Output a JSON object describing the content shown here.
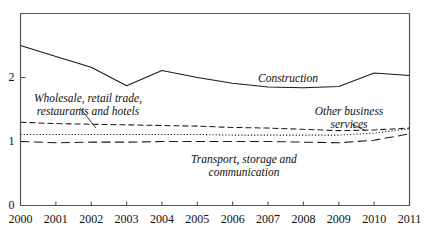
{
  "chart_data": {
    "type": "line",
    "title": "",
    "subtitle": "",
    "xlabel": "",
    "ylabel": "",
    "xlim": [
      2000,
      2011
    ],
    "ylim": [
      0,
      3
    ],
    "grid": false,
    "legend_position": "inline-annotations",
    "x": [
      2000,
      2001,
      2002,
      2003,
      2004,
      2005,
      2006,
      2007,
      2008,
      2009,
      2010,
      2011
    ],
    "xticklabels": [
      "2000",
      "2001",
      "2002",
      "2003",
      "2004",
      "2005",
      "2006",
      "2007",
      "2008",
      "2009",
      "2010",
      "2011"
    ],
    "yticks": [
      0,
      1,
      2
    ],
    "yticklabels": [
      "0",
      "1",
      "2"
    ],
    "series": [
      {
        "name": "Construction",
        "style": "solid",
        "values": [
          2.5,
          2.33,
          2.16,
          1.87,
          2.11,
          2.0,
          1.91,
          1.85,
          1.84,
          1.86,
          2.07,
          2.03
        ]
      },
      {
        "name": "Wholesale, retail trade, restaurants and hotels",
        "style": "dashed",
        "values": [
          1.3,
          1.28,
          1.27,
          1.26,
          1.25,
          1.24,
          1.22,
          1.21,
          1.19,
          1.17,
          1.18,
          1.21
        ]
      },
      {
        "name": "Other business services",
        "style": "dotted",
        "values": [
          1.11,
          1.11,
          1.11,
          1.11,
          1.11,
          1.11,
          1.1,
          1.1,
          1.1,
          1.1,
          1.13,
          1.2
        ]
      },
      {
        "name": "Transport, storage and communication",
        "style": "longdash",
        "values": [
          1.0,
          0.98,
          0.99,
          0.99,
          1.0,
          1.0,
          1.0,
          1.0,
          0.99,
          0.98,
          1.02,
          1.12
        ]
      }
    ],
    "annotations": [
      {
        "id": "construction",
        "text": "Construction",
        "x_px": 288,
        "y_px": 79
      },
      {
        "id": "wholesale",
        "text": "Wholesale, retail trade,\nrestaurants and hotels",
        "x_px": 88,
        "y_px": 99
      },
      {
        "id": "other-business-services",
        "text": "Other business\nservices",
        "x_px": 349,
        "y_px": 112
      },
      {
        "id": "transport",
        "text": "Transport, storage and\ncommunication",
        "x_px": 244,
        "y_px": 160
      }
    ],
    "colors": {
      "line": "#1a1a1a",
      "axis": "#555555",
      "text": "#111111",
      "background": "#ffffff"
    }
  }
}
